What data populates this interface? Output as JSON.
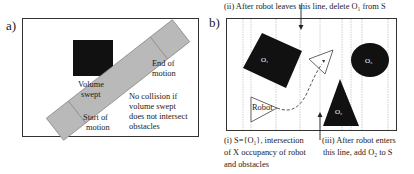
{
  "panel_a": {
    "label": "a)",
    "text_volume_swept_1": "Volume",
    "text_volume_swept_2": "swept",
    "text_end_1": "End of",
    "text_end_2": "motion",
    "text_start_1": "Start of",
    "text_start_2": "motion",
    "text_nocollision_1": "No collision if",
    "text_nocollision_2": "volume swept",
    "text_nocollision_3": "does not intersect",
    "text_nocollision_4": "obstacles"
  },
  "panel_b": {
    "label": "b)",
    "caption_ii": "(ii) After robot leaves this line, delete O₁ from S",
    "caption_i_1": "(i) S={O₁}, intersection",
    "caption_i_2": "of X occupancy of robot",
    "caption_i_3": "and obstacles",
    "caption_iii_1": "(iii) After robot enters",
    "caption_iii_2": "this line, add O₂ to S",
    "obstacle_1": "O₁",
    "obstacle_2": "O₂",
    "obstacle_3": "O₃",
    "robot_label": "Robot"
  },
  "colors": {
    "obstacle": "#111111",
    "swept": "#b8b8b8",
    "swept_border": "#8a8a8a",
    "grid_line": "#bdbdbd",
    "frame": "#333333"
  }
}
